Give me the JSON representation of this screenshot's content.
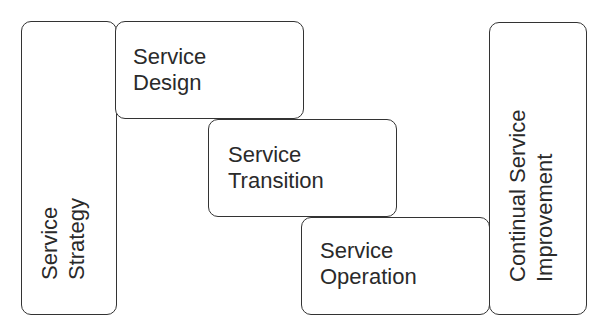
{
  "diagram": {
    "boxes": {
      "strategy": {
        "line1": "Service",
        "line2": "Strategy"
      },
      "design": {
        "line1": "Service",
        "line2": "Design"
      },
      "transition": {
        "line1": "Service",
        "line2": "Transition"
      },
      "operation": {
        "line1": "Service",
        "line2": "Operation"
      },
      "csi": {
        "line1": "Continual Service",
        "line2": "Improvement"
      }
    },
    "colors": {
      "border": "#333333",
      "text": "#2a2a2a",
      "background": "#ffffff"
    }
  }
}
